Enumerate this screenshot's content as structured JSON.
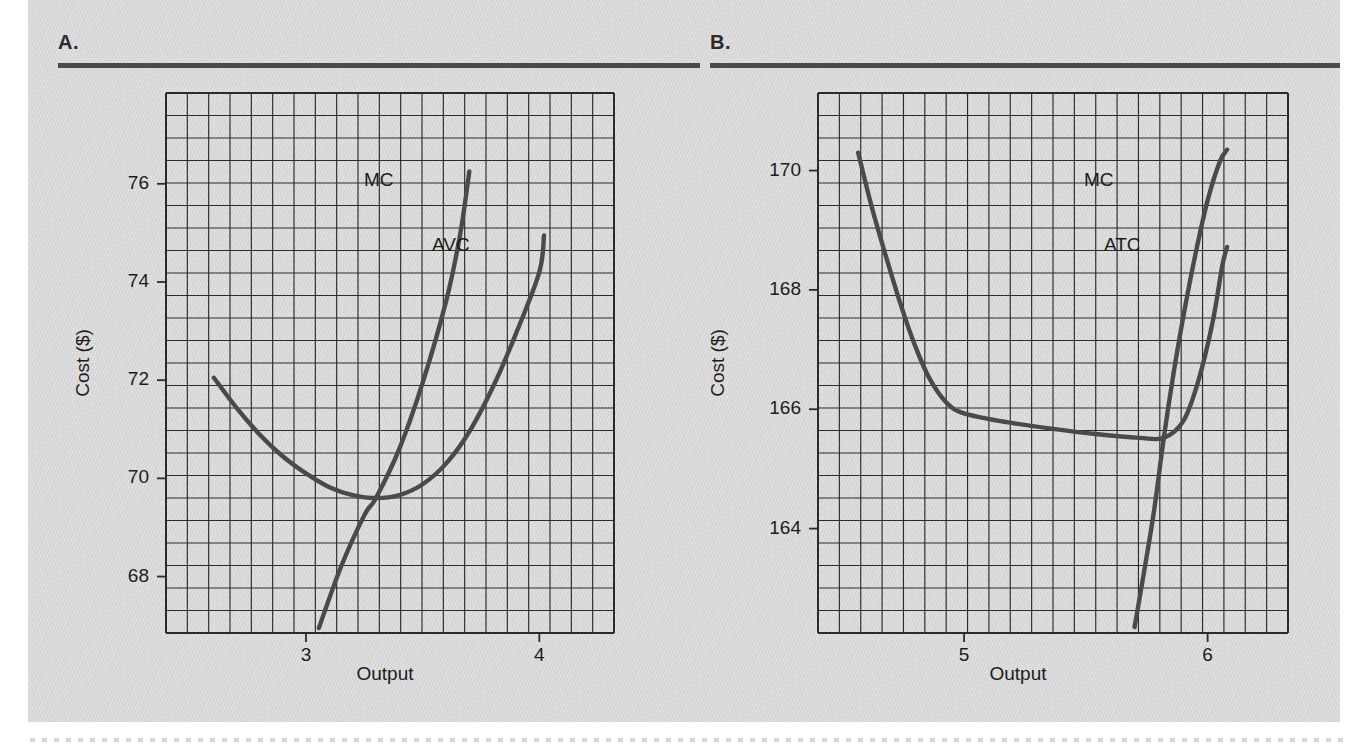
{
  "figure": {
    "background_color": "#d6d6d6",
    "page_color": "#ffffff",
    "grid_color": "#2b2b2b",
    "curve_color": "#4a4a4a",
    "rule_color": "#4a4a4a"
  },
  "panels": [
    {
      "letter": "A.",
      "xlabel": "Output",
      "ylabel": "Cost ($)",
      "x_ticks": [
        {
          "label": "3",
          "value": 3
        },
        {
          "label": "4",
          "value": 4
        }
      ],
      "y_ticks": [
        {
          "label": "68",
          "value": 68
        },
        {
          "label": "70",
          "value": 70
        },
        {
          "label": "72",
          "value": 72
        },
        {
          "label": "74",
          "value": 74
        },
        {
          "label": "76",
          "value": 76
        }
      ],
      "curve_labels": [
        {
          "text": "MC"
        },
        {
          "text": "AVC"
        }
      ]
    },
    {
      "letter": "B.",
      "xlabel": "Output",
      "ylabel": "Cost ($)",
      "x_ticks": [
        {
          "label": "5",
          "value": 5
        },
        {
          "label": "6",
          "value": 6
        }
      ],
      "y_ticks": [
        {
          "label": "164",
          "value": 164
        },
        {
          "label": "166",
          "value": 166
        },
        {
          "label": "168",
          "value": 168
        },
        {
          "label": "170",
          "value": 170
        }
      ],
      "curve_labels": [
        {
          "text": "MC"
        },
        {
          "text": "ATC"
        }
      ]
    }
  ],
  "chart_data": [
    {
      "type": "line",
      "title": "A.",
      "xlabel": "Output",
      "ylabel": "Cost ($)",
      "xlim": [
        2.4,
        4.32
      ],
      "ylim": [
        66.85,
        77.85
      ],
      "xticks": [
        3,
        4
      ],
      "yticks": [
        68,
        70,
        72,
        74,
        76
      ],
      "grid": true,
      "grid_step_x": 0.0915,
      "grid_step_y": 0.4583,
      "legend": "inline-labels",
      "series": [
        {
          "name": "AVC",
          "label_position": "right-end",
          "points": [
            {
              "x": 2.605,
              "y": 72.05
            },
            {
              "x": 2.7,
              "y": 71.45
            },
            {
              "x": 2.8,
              "y": 70.9
            },
            {
              "x": 2.9,
              "y": 70.45
            },
            {
              "x": 3.0,
              "y": 70.1
            },
            {
              "x": 3.1,
              "y": 69.82
            },
            {
              "x": 3.2,
              "y": 69.66
            },
            {
              "x": 3.3,
              "y": 69.6
            },
            {
              "x": 3.4,
              "y": 69.66
            },
            {
              "x": 3.5,
              "y": 69.88
            },
            {
              "x": 3.6,
              "y": 70.3
            },
            {
              "x": 3.7,
              "y": 70.95
            },
            {
              "x": 3.8,
              "y": 71.85
            },
            {
              "x": 3.9,
              "y": 72.95
            },
            {
              "x": 4.0,
              "y": 74.2
            },
            {
              "x": 4.02,
              "y": 74.95
            }
          ]
        },
        {
          "name": "MC",
          "label_position": "top-end",
          "points": [
            {
              "x": 3.055,
              "y": 66.95
            },
            {
              "x": 3.15,
              "y": 68.2
            },
            {
              "x": 3.25,
              "y": 69.25
            },
            {
              "x": 3.3,
              "y": 69.6
            },
            {
              "x": 3.4,
              "y": 70.6
            },
            {
              "x": 3.5,
              "y": 71.95
            },
            {
              "x": 3.6,
              "y": 73.6
            },
            {
              "x": 3.66,
              "y": 74.95
            },
            {
              "x": 3.7,
              "y": 76.25
            }
          ]
        }
      ],
      "annotations": [
        {
          "text": "MC crosses AVC at AVC minimum",
          "x": 3.3,
          "y": 69.6
        }
      ]
    },
    {
      "type": "line",
      "title": "B.",
      "xlabel": "Output",
      "ylabel": "Cost ($)",
      "xlim": [
        4.4,
        6.33
      ],
      "ylim": [
        162.25,
        171.3
      ],
      "xticks": [
        5,
        6
      ],
      "yticks": [
        164,
        166,
        168,
        170
      ],
      "grid": true,
      "grid_step_x": 0.0915,
      "grid_step_y": 0.3768,
      "legend": "inline-labels",
      "series": [
        {
          "name": "ATC",
          "label_position": "right-end",
          "points": [
            {
              "x": 4.565,
              "y": 170.3
            },
            {
              "x": 4.62,
              "y": 169.4
            },
            {
              "x": 4.68,
              "y": 168.55
            },
            {
              "x": 4.74,
              "y": 167.75
            },
            {
              "x": 4.8,
              "y": 167.05
            },
            {
              "x": 4.86,
              "y": 166.5
            },
            {
              "x": 4.93,
              "y": 166.1
            },
            {
              "x": 5.0,
              "y": 165.93
            },
            {
              "x": 5.15,
              "y": 165.8
            },
            {
              "x": 5.35,
              "y": 165.68
            },
            {
              "x": 5.55,
              "y": 165.58
            },
            {
              "x": 5.72,
              "y": 165.52
            },
            {
              "x": 5.82,
              "y": 165.52
            },
            {
              "x": 5.9,
              "y": 165.8
            },
            {
              "x": 5.96,
              "y": 166.45
            },
            {
              "x": 6.02,
              "y": 167.45
            },
            {
              "x": 6.06,
              "y": 168.4
            },
            {
              "x": 6.08,
              "y": 168.72
            }
          ]
        },
        {
          "name": "MC",
          "label_position": "top-end",
          "points": [
            {
              "x": 5.7,
              "y": 162.35
            },
            {
              "x": 5.74,
              "y": 163.3
            },
            {
              "x": 5.78,
              "y": 164.3
            },
            {
              "x": 5.82,
              "y": 165.52
            },
            {
              "x": 5.86,
              "y": 166.6
            },
            {
              "x": 5.9,
              "y": 167.55
            },
            {
              "x": 5.95,
              "y": 168.6
            },
            {
              "x": 6.0,
              "y": 169.5
            },
            {
              "x": 6.05,
              "y": 170.15
            },
            {
              "x": 6.08,
              "y": 170.35
            }
          ]
        }
      ],
      "annotations": [
        {
          "text": "MC crosses ATC at ATC minimum",
          "x": 5.82,
          "y": 165.52
        }
      ]
    }
  ]
}
